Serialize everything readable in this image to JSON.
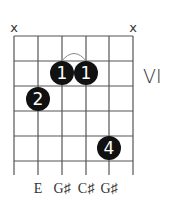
{
  "chord_diagram": {
    "position_label": "VI",
    "string_markers": [
      {
        "string": 1,
        "symbol": "x"
      },
      {
        "string": 6,
        "symbol": "x"
      }
    ],
    "fingers": [
      {
        "label": "1",
        "string": 3,
        "fret": 2
      },
      {
        "label": "1",
        "string": 4,
        "fret": 2
      },
      {
        "label": "2",
        "string": 2,
        "fret": 3
      },
      {
        "label": "4",
        "string": 5,
        "fret": 5
      }
    ],
    "barre": {
      "from_string": 3,
      "to_string": 4,
      "fret": 2
    },
    "notes": [
      {
        "string": 2,
        "label": "E"
      },
      {
        "string": 3,
        "label": "G♯"
      },
      {
        "string": 4,
        "label": "C♯"
      },
      {
        "string": 5,
        "label": "G♯"
      }
    ],
    "num_strings": 6,
    "num_frets": 5
  }
}
